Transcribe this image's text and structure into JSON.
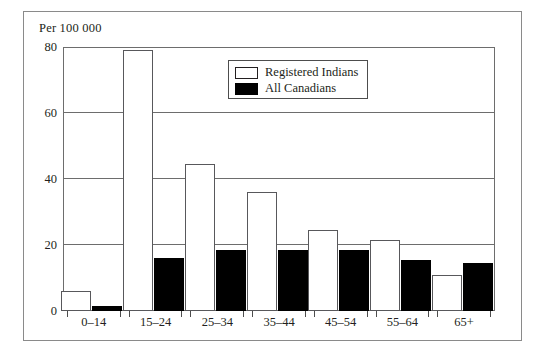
{
  "figure": {
    "axis_unit_caption": "Per 100 000"
  },
  "legend": {
    "position": "inside-top-center",
    "entries": [
      {
        "label": "Registered Indians",
        "swatch": "white-square-icon",
        "color": "#ffffff"
      },
      {
        "label": "All Canadians",
        "swatch": "black-square-icon",
        "color": "#000000"
      }
    ]
  },
  "chart_data": {
    "type": "bar",
    "title": "",
    "subtitle": "",
    "xlabel": "",
    "ylabel": "Per 100 000",
    "ylim": [
      0,
      80
    ],
    "yticks": [
      0,
      20,
      40,
      60,
      80
    ],
    "ytick_labels": [
      "0",
      "20",
      "40",
      "60",
      "80"
    ],
    "grid": true,
    "grid_axis": "y",
    "legend_position": "inside-top-center",
    "categories": [
      "0–14",
      "15–24",
      "25–34",
      "35–44",
      "45–54",
      "55–64",
      "65+"
    ],
    "series": [
      {
        "name": "Registered Indians",
        "color": "#ffffff",
        "edge_color": "#58585b",
        "values": [
          6,
          79,
          44.5,
          36,
          24.5,
          21.5,
          11
        ]
      },
      {
        "name": "All Canadians",
        "color": "#000000",
        "edge_color": "#000000",
        "values": [
          1.5,
          16,
          18.5,
          18.5,
          18.5,
          15.5,
          14.5
        ]
      }
    ]
  }
}
